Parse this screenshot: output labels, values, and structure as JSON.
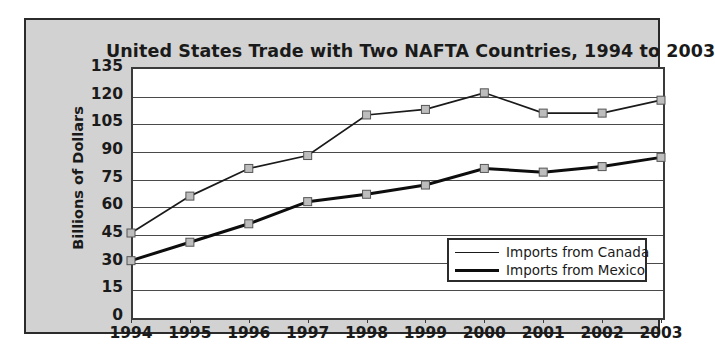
{
  "chart_data": {
    "type": "line",
    "title": "United States Trade with Two NAFTA Countries, 1994 to 2003",
    "xlabel": "",
    "ylabel": "Billions of Dollars",
    "categories": [
      "1994",
      "1995",
      "1996",
      "1997",
      "1998",
      "1999",
      "2000",
      "2001",
      "2002",
      "2003"
    ],
    "x": [
      1994,
      1995,
      1996,
      1997,
      1998,
      1999,
      2000,
      2001,
      2002,
      2003
    ],
    "ylim": [
      0,
      135
    ],
    "ytick_labels": [
      "135",
      "120",
      "105",
      "90",
      "75",
      "60",
      "45",
      "30",
      "15",
      "0"
    ],
    "yticks": [
      135,
      120,
      105,
      90,
      75,
      60,
      45,
      30,
      15,
      0
    ],
    "grid": true,
    "legend_position": "inside-lower-right",
    "series": [
      {
        "name": "Imports from Canada",
        "line_style": "thin",
        "marker": "square",
        "values": [
          45,
          65,
          80,
          87,
          109,
          112,
          121,
          110,
          110,
          117
        ]
      },
      {
        "name": "Imports from Mexico",
        "line_style": "thick",
        "marker": "square",
        "values": [
          30,
          40,
          50,
          62,
          66,
          71,
          80,
          78,
          81,
          86
        ]
      }
    ]
  },
  "legend": {
    "items": [
      {
        "label": "Imports from Canada",
        "style": "thin"
      },
      {
        "label": "Imports from Mexico",
        "style": "thick"
      }
    ]
  },
  "colors": {
    "panel_background": "#d2d2d2",
    "plot_background": "#ffffff",
    "border": "#2b2b2b",
    "gridline": "#4a4a4a",
    "series_canada": "#1a1a1a",
    "series_mexico": "#0d0d0d",
    "marker_fill": "#bdbdbd",
    "text": "#1a1a1a"
  }
}
